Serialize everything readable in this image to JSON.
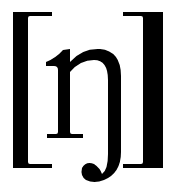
{
  "symbol": {
    "text": "[ŋ]",
    "open_bracket": "[",
    "character": "ŋ",
    "close_bracket": "]",
    "description": "IPA velar nasal",
    "color": "#000000",
    "background": "#ffffff"
  }
}
